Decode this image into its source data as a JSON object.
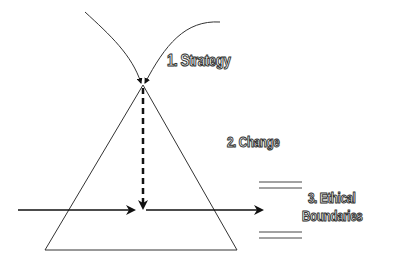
{
  "labels": {
    "strategy": "1. Strategy",
    "change": "2. Change",
    "ethical_line1": "3. Ethical",
    "ethical_line2": "Boundaries"
  },
  "colors": {
    "line": "#222222",
    "background": "#ffffff"
  }
}
